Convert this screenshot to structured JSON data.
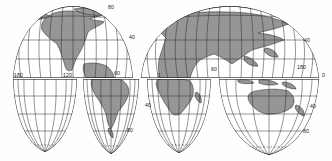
{
  "figure": {
    "name": "interrupted-world-map",
    "type": "map-projection",
    "projection": "interrupted homolosine (Goode-style) world map",
    "background_color": "#fefefe",
    "land_fill_color": "#969696",
    "graticule_color": "#2b2b2b",
    "outline_color": "#1a1a1a",
    "label_color": "#1a1a1a"
  },
  "labels": [
    {
      "id": "lon-180-west",
      "text": "180",
      "kind": "longitude",
      "x": 14,
      "y": 76
    },
    {
      "id": "lon-120-west",
      "text": "120",
      "kind": "longitude",
      "x": 63,
      "y": 76
    },
    {
      "id": "lon-60-west",
      "text": "60",
      "kind": "longitude",
      "x": 114,
      "y": 74
    },
    {
      "id": "lon-0-prime",
      "text": "0",
      "kind": "longitude",
      "x": 157,
      "y": 76
    },
    {
      "id": "lon-60-east",
      "text": "60",
      "kind": "longitude",
      "x": 211,
      "y": 70
    },
    {
      "id": "lon-180-east",
      "text": "180",
      "kind": "longitude",
      "x": 297,
      "y": 68
    },
    {
      "id": "lat-80-north",
      "text": "80",
      "kind": "latitude",
      "x": 108,
      "y": 8
    },
    {
      "id": "lat-40-north-left",
      "text": "40",
      "kind": "latitude",
      "x": 129,
      "y": 38
    },
    {
      "id": "lat-40-north-right",
      "text": "40",
      "kind": "latitude",
      "x": 304,
      "y": 41
    },
    {
      "id": "lat-0-equator",
      "text": "0",
      "kind": "latitude",
      "x": 322,
      "y": 76
    },
    {
      "id": "lat-40-south-left",
      "text": "40",
      "kind": "latitude",
      "x": 145,
      "y": 106
    },
    {
      "id": "lat-40-south-right",
      "text": "40",
      "kind": "latitude",
      "x": 310,
      "y": 107
    },
    {
      "id": "lat-80-south-left",
      "text": "80",
      "kind": "latitude",
      "x": 127,
      "y": 131
    },
    {
      "id": "lat-80-south-right",
      "text": "80",
      "kind": "latitude",
      "x": 303,
      "y": 132
    }
  ],
  "lobes": [
    {
      "id": "lobe-north-americas",
      "hemisphere": "north",
      "left": 12,
      "right": 134
    },
    {
      "id": "lobe-north-eurafrasia",
      "hemisphere": "north",
      "left": 140,
      "right": 320
    },
    {
      "id": "lobe-south-pacific",
      "hemisphere": "south",
      "left": 12,
      "right": 78
    },
    {
      "id": "lobe-south-samerica",
      "hemisphere": "south",
      "left": 82,
      "right": 140
    },
    {
      "id": "lobe-south-africa",
      "hemisphere": "south",
      "left": 146,
      "right": 212
    },
    {
      "id": "lobe-south-australia",
      "hemisphere": "south",
      "left": 218,
      "right": 320
    }
  ],
  "landmasses": [
    {
      "id": "north-america",
      "lobe": "lobe-north-americas"
    },
    {
      "id": "greenland",
      "lobe": "lobe-north-americas"
    },
    {
      "id": "south-america",
      "lobe": "lobe-south-samerica"
    },
    {
      "id": "europe",
      "lobe": "lobe-north-eurafrasia"
    },
    {
      "id": "africa-north",
      "lobe": "lobe-north-eurafrasia"
    },
    {
      "id": "asia",
      "lobe": "lobe-north-eurafrasia"
    },
    {
      "id": "africa-south",
      "lobe": "lobe-south-africa"
    },
    {
      "id": "madagascar",
      "lobe": "lobe-south-africa"
    },
    {
      "id": "australia",
      "lobe": "lobe-south-australia"
    },
    {
      "id": "new-zealand",
      "lobe": "lobe-south-australia"
    },
    {
      "id": "indonesia",
      "lobe": "lobe-south-australia"
    }
  ]
}
